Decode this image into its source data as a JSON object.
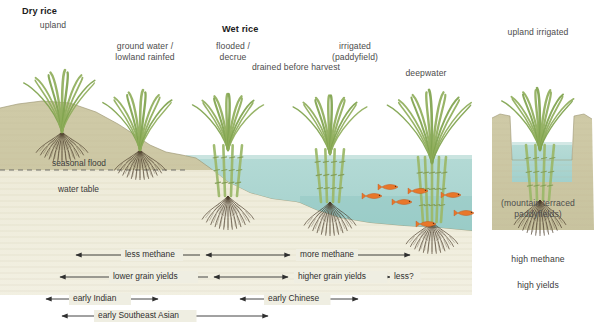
{
  "diagram": {
    "title_left": "Dry rice",
    "title_center": "Wet rice",
    "colors": {
      "soil_upper": "#cdc8a4",
      "soil_lower": "#ece9d6",
      "water": "#a6d3cf",
      "water_deep": "#8ec7c4",
      "stem": "#9cb86a",
      "leaf": "#8fae5b",
      "root": "#4a3b2a",
      "fish": "#e8772a",
      "text": "#4c4c4c"
    },
    "headings": [
      {
        "text": "Dry rice",
        "bold": true,
        "x": 22,
        "y": 6
      },
      {
        "text": "Wet rice",
        "bold": true,
        "x": 222,
        "y": 24
      }
    ],
    "crop_labels": [
      {
        "id": "upland",
        "text": "upland",
        "x": 18,
        "y": 20,
        "w": 70
      },
      {
        "id": "ground-water",
        "text": "ground water /\nlowland rainfed",
        "x": 95,
        "y": 41,
        "w": 100
      },
      {
        "id": "flooded-decrue",
        "text": "flooded /\ndecrue",
        "x": 198,
        "y": 41,
        "w": 70
      },
      {
        "id": "drained",
        "text": "drained before harvest",
        "x": 236,
        "y": 62,
        "w": 120
      },
      {
        "id": "irrigated",
        "text": "irrigated\n(paddyfield)",
        "x": 315,
        "y": 41,
        "w": 80
      },
      {
        "id": "deepwater",
        "text": "deepwater",
        "x": 390,
        "y": 68,
        "w": 72
      },
      {
        "id": "upland-irrigated",
        "text": "upland irrigated",
        "x": 490,
        "y": 27,
        "w": 96
      },
      {
        "id": "mountain-terraced",
        "text": "(mountain terraced\npaddyfields)",
        "x": 480,
        "y": 198,
        "w": 116
      }
    ],
    "soil_labels": [
      {
        "id": "seasonal-flood",
        "text": "seasonal flood",
        "x": 52,
        "y": 158
      },
      {
        "id": "water-table",
        "text": "water table",
        "x": 58,
        "y": 184
      }
    ],
    "right_notes": [
      {
        "id": "high-methane",
        "text": "high methane",
        "x": 490,
        "y": 254,
        "w": 96
      },
      {
        "id": "high-yields",
        "text": "high yields",
        "x": 490,
        "y": 280,
        "w": 96
      }
    ],
    "arrow_rows": [
      {
        "id": "methane",
        "y": 255,
        "segments": [
          {
            "id": "less-methane",
            "label": "less methane",
            "x1": 76,
            "x2": 200,
            "label_x": 125,
            "head_left": true,
            "head_right": false
          },
          {
            "id": "less-methane-r",
            "label": "",
            "x1": 206,
            "x2": 290,
            "label_x": 0,
            "head_left": true,
            "head_right": true
          },
          {
            "id": "more-methane",
            "label": "more methane",
            "x1": 296,
            "x2": 410,
            "label_x": 300,
            "head_left": false,
            "head_right": true
          }
        ]
      },
      {
        "id": "yields",
        "y": 277,
        "segments": [
          {
            "id": "lower-grain-yields",
            "label": "lower grain yields",
            "x1": 60,
            "x2": 208,
            "label_x": 113,
            "head_left": true,
            "head_right": false
          },
          {
            "id": "mid-yields",
            "label": "",
            "x1": 214,
            "x2": 288,
            "label_x": 0,
            "head_left": true,
            "head_right": true
          },
          {
            "id": "higher-grain-yields",
            "label": "higher grain yields",
            "x1": 294,
            "x2": 390,
            "label_x": 298,
            "head_left": false,
            "head_right": true
          },
          {
            "id": "less-question",
            "label": "less?",
            "x1": 392,
            "x2": 392,
            "label_x": 394,
            "head_left": false,
            "head_right": false
          }
        ]
      },
      {
        "id": "origins",
        "y": 299,
        "segments": [
          {
            "id": "early-indian",
            "label": "early Indian",
            "x1": 46,
            "x2": 158,
            "label_x": 73,
            "head_left": true,
            "head_right": true
          },
          {
            "id": "early-chinese",
            "label": "early Chinese",
            "x1": 240,
            "x2": 358,
            "label_x": 268,
            "head_left": true,
            "head_right": true
          }
        ]
      },
      {
        "id": "southeast",
        "y": 316,
        "segments": [
          {
            "id": "early-southeast-asian",
            "label": "early Southeast Asian",
            "x1": 62,
            "x2": 268,
            "label_x": 98,
            "head_left": true,
            "head_right": true
          }
        ]
      }
    ],
    "plants": [
      {
        "id": "plant-upland",
        "x": 62,
        "ground": 132,
        "height": 62,
        "blades": 11,
        "stems": 0,
        "root_depth": 30
      },
      {
        "id": "plant-lowland-rainfed",
        "x": 140,
        "ground": 150,
        "height": 60,
        "blades": 11,
        "stems": 0,
        "root_depth": 30
      },
      {
        "id": "plant-flooded-decrue",
        "x": 228,
        "ground": 196,
        "height": 92,
        "blades": 12,
        "stems": 4,
        "root_depth": 34
      },
      {
        "id": "plant-irrigated",
        "x": 330,
        "ground": 202,
        "height": 96,
        "blades": 12,
        "stems": 4,
        "root_depth": 34
      },
      {
        "id": "plant-deepwater",
        "x": 432,
        "ground": 222,
        "height": 118,
        "blades": 13,
        "stems": 5,
        "root_depth": 32
      },
      {
        "id": "plant-upland-irrigated",
        "x": 540,
        "ground": 200,
        "height": 100,
        "blades": 13,
        "stems": 4,
        "root_depth": 36
      }
    ],
    "fish": [
      {
        "id": "fish-1",
        "x": 382,
        "y": 187,
        "flip": false
      },
      {
        "id": "fish-2",
        "x": 366,
        "y": 196,
        "flip": false
      },
      {
        "id": "fish-3",
        "x": 396,
        "y": 202,
        "flip": false
      },
      {
        "id": "fish-4",
        "x": 412,
        "y": 191,
        "flip": false
      },
      {
        "id": "fish-5",
        "x": 445,
        "y": 195,
        "flip": false
      },
      {
        "id": "fish-6",
        "x": 458,
        "y": 213,
        "flip": false
      },
      {
        "id": "fish-7",
        "x": 420,
        "y": 224,
        "flip": false
      }
    ]
  }
}
